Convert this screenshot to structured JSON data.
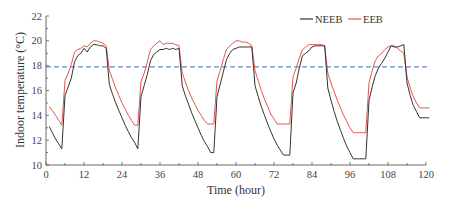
{
  "chart_data": {
    "type": "line",
    "title": "",
    "xlabel": "Time (hour)",
    "ylabel": "Indoor temperature (°C)",
    "xlim": [
      0,
      120
    ],
    "ylim": [
      10,
      22
    ],
    "x_ticks": [
      0,
      12,
      24,
      36,
      48,
      60,
      72,
      84,
      96,
      108,
      120
    ],
    "y_ticks": [
      10,
      12,
      14,
      16,
      18,
      20,
      22
    ],
    "grid": false,
    "legend_position": "top-right",
    "reference_line": {
      "y": 17.9,
      "style": "dashed",
      "color": "#4a6fb5"
    },
    "x": [
      1,
      2,
      3,
      4,
      5,
      6,
      7,
      8,
      9,
      10,
      11,
      12,
      13,
      14,
      15,
      16,
      17,
      18,
      19,
      20,
      21,
      22,
      23,
      24,
      25,
      26,
      27,
      28,
      29,
      30,
      31,
      32,
      33,
      34,
      35,
      36,
      37,
      38,
      39,
      40,
      41,
      42,
      43,
      44,
      45,
      46,
      47,
      48,
      49,
      50,
      51,
      52,
      53,
      54,
      55,
      56,
      57,
      58,
      59,
      60,
      61,
      62,
      63,
      64,
      65,
      66,
      67,
      68,
      69,
      70,
      71,
      72,
      73,
      74,
      75,
      76,
      77,
      78,
      79,
      80,
      81,
      82,
      83,
      84,
      85,
      86,
      87,
      88,
      89,
      90,
      91,
      92,
      93,
      94,
      95,
      96,
      97,
      98,
      99,
      100,
      101,
      102,
      103,
      104,
      105,
      106,
      107,
      108,
      109,
      110,
      111,
      112,
      113,
      114,
      115,
      116,
      117,
      118,
      119,
      120,
      121
    ],
    "series": [
      {
        "name": "NEEB",
        "color": "#333333",
        "values": [
          13.1,
          12.6,
          12.1,
          11.7,
          11.3,
          15.6,
          16.3,
          17.0,
          18.3,
          18.8,
          19.0,
          19.4,
          19.1,
          19.5,
          19.7,
          19.7,
          19.6,
          19.6,
          19.4,
          16.5,
          15.7,
          15.0,
          14.4,
          13.8,
          13.2,
          12.7,
          12.2,
          11.8,
          11.3,
          15.5,
          16.4,
          17.3,
          18.4,
          18.9,
          19.1,
          19.3,
          19.3,
          19.4,
          19.3,
          19.4,
          19.3,
          19.4,
          16.4,
          15.6,
          14.9,
          14.2,
          13.6,
          13.0,
          12.4,
          11.9,
          11.5,
          11.0,
          11.0,
          15.5,
          16.5,
          17.5,
          18.5,
          19.0,
          19.3,
          19.4,
          19.5,
          19.5,
          19.5,
          19.5,
          19.5,
          16.4,
          15.5,
          14.7,
          14.0,
          13.3,
          12.7,
          12.1,
          11.6,
          11.2,
          10.8,
          10.8,
          10.8,
          15.8,
          16.6,
          17.8,
          18.8,
          19.0,
          19.2,
          19.5,
          19.6,
          19.6,
          19.6,
          19.6,
          16.2,
          15.2,
          14.3,
          13.5,
          12.8,
          12.1,
          11.5,
          11.0,
          10.5,
          10.5,
          10.5,
          10.5,
          10.5,
          15.2,
          16.3,
          17.2,
          17.8,
          18.2,
          18.6,
          19.1,
          19.6,
          19.5,
          19.5,
          19.6,
          19.7,
          16.6,
          15.6,
          14.8,
          14.3,
          13.8,
          13.8,
          13.8,
          13.8
        ]
      },
      {
        "name": "EEB",
        "color": "#e0574f",
        "values": [
          14.7,
          14.4,
          14.0,
          13.6,
          13.2,
          16.8,
          17.4,
          18.1,
          19.1,
          19.3,
          19.4,
          19.6,
          19.5,
          19.8,
          20.0,
          20.0,
          19.9,
          19.8,
          19.6,
          17.6,
          16.9,
          16.2,
          15.6,
          15.0,
          14.5,
          14.0,
          13.6,
          13.2,
          13.2,
          16.7,
          17.4,
          18.3,
          19.3,
          19.6,
          19.8,
          20.0,
          19.7,
          19.8,
          19.8,
          19.8,
          19.7,
          19.6,
          17.4,
          16.7,
          16.0,
          15.4,
          14.9,
          14.4,
          14.0,
          13.6,
          13.3,
          13.3,
          13.3,
          16.8,
          17.6,
          18.5,
          19.3,
          19.6,
          19.8,
          20.0,
          20.0,
          19.9,
          19.9,
          19.8,
          19.6,
          17.6,
          16.8,
          16.0,
          15.3,
          14.7,
          14.1,
          13.7,
          13.3,
          13.3,
          13.3,
          13.3,
          13.3,
          17.1,
          17.8,
          18.6,
          19.3,
          19.5,
          19.7,
          19.7,
          19.7,
          19.7,
          19.7,
          19.6,
          17.4,
          16.6,
          15.9,
          15.2,
          14.6,
          14.0,
          13.5,
          13.0,
          12.6,
          12.6,
          12.6,
          12.6,
          12.6,
          16.6,
          17.6,
          18.4,
          18.8,
          19.0,
          19.3,
          19.5,
          19.6,
          19.6,
          19.4,
          19.2,
          19.0,
          17.1,
          16.2,
          15.5,
          15.0,
          14.6,
          14.6,
          14.6,
          14.6
        ]
      }
    ]
  }
}
